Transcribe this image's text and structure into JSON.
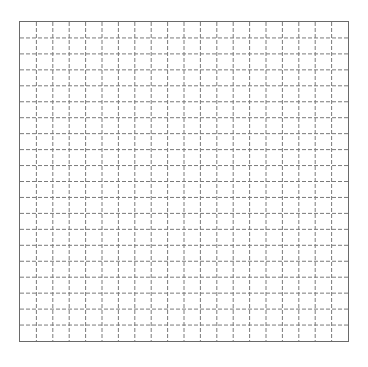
{
  "grid": {
    "columns": 20,
    "rows": 20,
    "line_color": "#7a7a7a",
    "border_color": "#6a6a6a",
    "dash_pattern": "4,2",
    "background": "#ffffff"
  }
}
